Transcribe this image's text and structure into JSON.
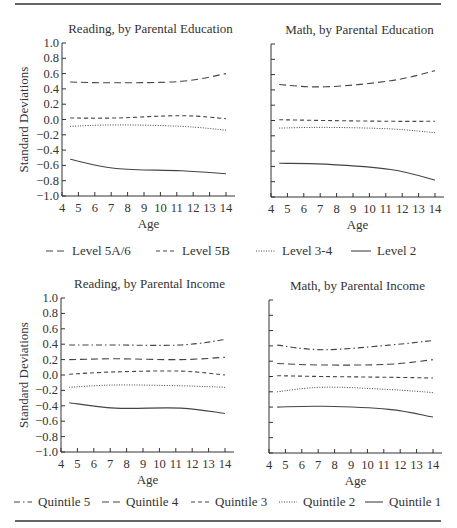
{
  "figure": {
    "legend_education": [
      {
        "label": "Level 5A/6",
        "style": "longdash"
      },
      {
        "label": "Level 5B",
        "style": "shortdash"
      },
      {
        "label": "Level 3-4",
        "style": "dotted"
      },
      {
        "label": "Level 2",
        "style": "solid"
      }
    ],
    "legend_income": [
      {
        "label": "Quintile 5",
        "style": "dashdot"
      },
      {
        "label": "Quintile 4",
        "style": "longdash"
      },
      {
        "label": "Quintile 3",
        "style": "shortdash"
      },
      {
        "label": "Quintile 2",
        "style": "dotted"
      },
      {
        "label": "Quintile 1",
        "style": "solid"
      }
    ],
    "line_color": "#444444"
  },
  "chart_data": [
    {
      "type": "line",
      "title": "Reading, by Parental Education",
      "xlabel": "Age",
      "ylabel": "Standard Deviations",
      "xlim": [
        4,
        14
      ],
      "ylim": [
        -1.0,
        1.0
      ],
      "xticks": [
        4,
        5,
        6,
        7,
        8,
        9,
        10,
        11,
        12,
        13,
        14
      ],
      "yticks": [
        "1.0",
        "0.8",
        "0.6",
        "0.4",
        "0.2",
        "0.0",
        "−0.2",
        "−0.4",
        "−0.6",
        "−0.8",
        "−1.0"
      ],
      "grid": false,
      "series": [
        {
          "name": "Level 5A/6",
          "style": "longdash",
          "x": [
            4.5,
            7.3,
            11.3,
            14
          ],
          "y": [
            0.49,
            0.48,
            0.5,
            0.6
          ]
        },
        {
          "name": "Level 5B",
          "style": "shortdash",
          "x": [
            4.5,
            7.3,
            11.3,
            14
          ],
          "y": [
            0.02,
            0.02,
            0.05,
            0.01
          ]
        },
        {
          "name": "Level 3-4",
          "style": "dotted",
          "x": [
            4.5,
            7.3,
            11.3,
            14
          ],
          "y": [
            -0.09,
            -0.07,
            -0.09,
            -0.14
          ]
        },
        {
          "name": "Level 2",
          "style": "solid",
          "x": [
            4.5,
            7.3,
            11.3,
            14
          ],
          "y": [
            -0.52,
            -0.64,
            -0.67,
            -0.71
          ]
        }
      ]
    },
    {
      "type": "line",
      "title": "Math, by Parental Education",
      "xlabel": "Age",
      "ylabel": "",
      "xlim": [
        4,
        14
      ],
      "ylim": [
        -1.0,
        1.0
      ],
      "xticks": [
        4,
        5,
        6,
        7,
        8,
        9,
        10,
        11,
        12,
        13,
        14
      ],
      "yticks": [],
      "grid": false,
      "series": [
        {
          "name": "Level 5A/6",
          "style": "longdash",
          "x": [
            4.5,
            7.3,
            11.3,
            14
          ],
          "y": [
            0.47,
            0.44,
            0.52,
            0.65
          ]
        },
        {
          "name": "Level 5B",
          "style": "shortdash",
          "x": [
            4.5,
            7.3,
            11.3,
            14
          ],
          "y": [
            0.01,
            0.0,
            -0.01,
            -0.01
          ]
        },
        {
          "name": "Level 3-4",
          "style": "dotted",
          "x": [
            4.5,
            7.3,
            11.3,
            14
          ],
          "y": [
            -0.1,
            -0.09,
            -0.11,
            -0.16
          ]
        },
        {
          "name": "Level 2",
          "style": "solid",
          "x": [
            4.5,
            7.3,
            11.3,
            14
          ],
          "y": [
            -0.56,
            -0.57,
            -0.64,
            -0.78
          ]
        }
      ]
    },
    {
      "type": "line",
      "title": "Reading, by Parental Income",
      "xlabel": "Age",
      "ylabel": "Standard Deviations",
      "xlim": [
        4,
        14
      ],
      "ylim": [
        -1.0,
        1.0
      ],
      "xticks": [
        4,
        5,
        6,
        7,
        8,
        9,
        10,
        11,
        12,
        13,
        14
      ],
      "yticks": [
        "1.0",
        "0.8",
        "0.6",
        "0.4",
        "0.2",
        "0.0",
        "−0.2",
        "−0.4",
        "−0.6",
        "−0.8",
        "−1.0"
      ],
      "grid": false,
      "series": [
        {
          "name": "Quintile 5",
          "style": "dashdot",
          "x": [
            4.5,
            7.3,
            11.3,
            14
          ],
          "y": [
            0.39,
            0.39,
            0.39,
            0.46
          ]
        },
        {
          "name": "Quintile 4",
          "style": "longdash",
          "x": [
            4.5,
            7.3,
            11.3,
            14
          ],
          "y": [
            0.2,
            0.21,
            0.2,
            0.23
          ]
        },
        {
          "name": "Quintile 3",
          "style": "shortdash",
          "x": [
            4.5,
            7.3,
            11.3,
            14
          ],
          "y": [
            0.01,
            0.04,
            0.05,
            0.0
          ]
        },
        {
          "name": "Quintile 2",
          "style": "dotted",
          "x": [
            4.5,
            7.3,
            11.3,
            14
          ],
          "y": [
            -0.16,
            -0.13,
            -0.14,
            -0.16
          ]
        },
        {
          "name": "Quintile 1",
          "style": "solid",
          "x": [
            4.5,
            7.3,
            11.3,
            14
          ],
          "y": [
            -0.36,
            -0.43,
            -0.43,
            -0.5
          ]
        }
      ]
    },
    {
      "type": "line",
      "title": "Math, by Parental Income",
      "xlabel": "Age",
      "ylabel": "",
      "xlim": [
        4,
        14
      ],
      "ylim": [
        -1.0,
        1.0
      ],
      "xticks": [
        4,
        5,
        6,
        7,
        8,
        9,
        10,
        11,
        12,
        13,
        14
      ],
      "yticks": [],
      "grid": false,
      "series": [
        {
          "name": "Quintile 5",
          "style": "dashdot",
          "x": [
            4.5,
            7.3,
            11.3,
            14
          ],
          "y": [
            0.41,
            0.35,
            0.41,
            0.47
          ]
        },
        {
          "name": "Quintile 4",
          "style": "longdash",
          "x": [
            4.5,
            7.3,
            11.3,
            14
          ],
          "y": [
            0.17,
            0.15,
            0.16,
            0.22
          ]
        },
        {
          "name": "Quintile 3",
          "style": "shortdash",
          "x": [
            4.5,
            7.3,
            11.3,
            14
          ],
          "y": [
            0.01,
            0.0,
            -0.01,
            -0.02
          ]
        },
        {
          "name": "Quintile 2",
          "style": "dotted",
          "x": [
            4.5,
            7.3,
            11.3,
            14
          ],
          "y": [
            -0.2,
            -0.14,
            -0.17,
            -0.21
          ]
        },
        {
          "name": "Quintile 1",
          "style": "solid",
          "x": [
            4.5,
            7.3,
            11.3,
            14
          ],
          "y": [
            -0.4,
            -0.39,
            -0.43,
            -0.53
          ]
        }
      ]
    }
  ]
}
